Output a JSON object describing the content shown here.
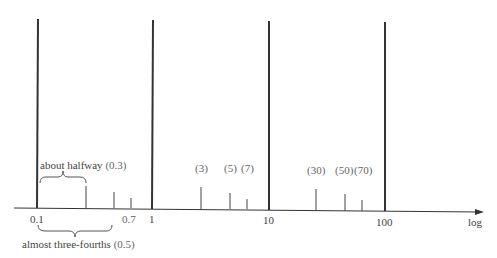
{
  "diagram": {
    "axis_label": "log",
    "major_ticks": [
      {
        "label": "0.1",
        "value": 0.1
      },
      {
        "label": "1",
        "value": 1
      },
      {
        "label": "10",
        "value": 10
      },
      {
        "label": "100",
        "value": 100
      }
    ],
    "minor_ticks": [
      {
        "value": 0.3,
        "label": ""
      },
      {
        "value": 0.5,
        "label": ""
      },
      {
        "value": 0.7,
        "label": "0.7"
      },
      {
        "value": 3,
        "label": "(3)"
      },
      {
        "value": 5,
        "label": "(5)"
      },
      {
        "value": 7,
        "label": "(7)"
      },
      {
        "value": 30,
        "label": "(30)"
      },
      {
        "value": 50,
        "label": "(50)"
      },
      {
        "value": 70,
        "label": "(70)"
      }
    ],
    "annotations": {
      "halfway_text": "about halfway",
      "halfway_value": "(0.3)",
      "three_fourths_text": "almost three-fourths",
      "three_fourths_value": "(0.5)"
    }
  }
}
